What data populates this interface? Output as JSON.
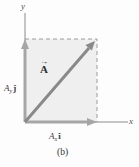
{
  "figure": {
    "caption": "(b)",
    "axes": {
      "x_label": "x",
      "y_label": "y"
    },
    "vector": {
      "label": "A",
      "arrow_symbol": "→"
    },
    "components": {
      "y": {
        "base": "A",
        "sub": "y",
        "unit": "ĵ"
      },
      "x": {
        "base": "A",
        "sub": "x",
        "unit": "î"
      }
    },
    "colors": {
      "background": "#fdfdfd",
      "box_fill": "#efefef",
      "component_arrow": "#a6a6a6",
      "vector_arrow": "#898989",
      "dashed_line": "#9c9c9c",
      "axis_line": "#8c8c8c",
      "text": "#3c3c3c"
    }
  }
}
